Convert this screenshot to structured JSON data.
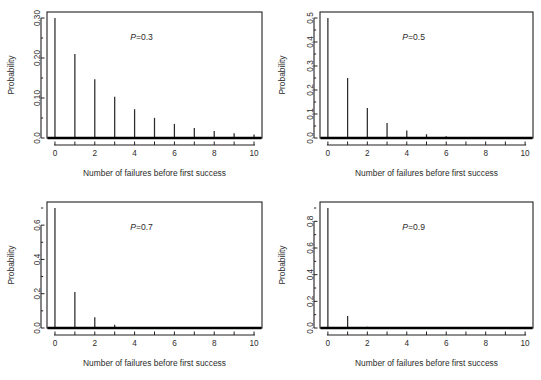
{
  "figure": {
    "title": "",
    "panel_count": 4,
    "width": 541,
    "height": 380
  },
  "chart_data": [
    {
      "type": "bar",
      "panel_id": "p-0-3",
      "title": "",
      "annotation": "P=0.3",
      "annotation_italic_part": "P",
      "annotation_rest": "=0.3",
      "probability_p": 0.3,
      "xlabel": "Number of failures before first success",
      "ylabel": "Probability",
      "x": [
        0,
        1,
        2,
        3,
        4,
        5,
        6,
        7,
        8,
        9,
        10
      ],
      "values": [
        0.3,
        0.21,
        0.147,
        0.1029,
        0.07203,
        0.050421,
        0.0352947,
        0.02470629,
        0.0172944,
        0.01210608,
        0.00847426
      ],
      "categories": [
        "0",
        "1",
        "2",
        "3",
        "4",
        "5",
        "6",
        "7",
        "8",
        "9",
        "10"
      ],
      "xlim": [
        -0.4,
        10.4
      ],
      "ylim": [
        0.0,
        0.315
      ],
      "ytick_values": [
        0.0,
        0.1,
        0.2,
        0.3
      ],
      "ytick_labels": [
        "0.0",
        "0.10",
        "0.20",
        "0.30"
      ],
      "yminor_values": [
        0.05,
        0.15,
        0.25
      ],
      "xtick_values": [
        0,
        1,
        2,
        3,
        4,
        5,
        6,
        7,
        8,
        9,
        10
      ],
      "xtick_labels": [
        "0",
        "",
        "2",
        "",
        "4",
        "",
        "6",
        "",
        "8",
        "",
        "10"
      ],
      "grid": false,
      "legend": "none"
    },
    {
      "type": "bar",
      "panel_id": "p-0-5",
      "title": "",
      "annotation": "P=0.5",
      "annotation_italic_part": "P",
      "annotation_rest": "=0.5",
      "probability_p": 0.5,
      "xlabel": "Number of failures before first success",
      "ylabel": "Probability",
      "x": [
        0,
        1,
        2,
        3,
        4,
        5,
        6,
        7,
        8,
        9,
        10
      ],
      "values": [
        0.5,
        0.25,
        0.125,
        0.0625,
        0.03125,
        0.015625,
        0.0078125,
        0.00390625,
        0.001953125,
        0.0009765625,
        0.00048828
      ],
      "categories": [
        "0",
        "1",
        "2",
        "3",
        "4",
        "5",
        "6",
        "7",
        "8",
        "9",
        "10"
      ],
      "xlim": [
        -0.4,
        10.4
      ],
      "ylim": [
        0.0,
        0.525
      ],
      "ytick_values": [
        0.0,
        0.1,
        0.2,
        0.3,
        0.4,
        0.5
      ],
      "ytick_labels": [
        "0.0",
        "0.1",
        "0.2",
        "0.3",
        "0.4",
        "0.5"
      ],
      "yminor_values": [
        0.05,
        0.15,
        0.25,
        0.35,
        0.45
      ],
      "xtick_values": [
        0,
        1,
        2,
        3,
        4,
        5,
        6,
        7,
        8,
        9,
        10
      ],
      "xtick_labels": [
        "0",
        "",
        "2",
        "",
        "4",
        "",
        "6",
        "",
        "8",
        "",
        "10"
      ],
      "grid": false,
      "legend": "none"
    },
    {
      "type": "bar",
      "panel_id": "p-0-7",
      "title": "",
      "annotation": "P=0.7",
      "annotation_italic_part": "P",
      "annotation_rest": "=0.7",
      "probability_p": 0.7,
      "xlabel": "Number of failures before first success",
      "ylabel": "Probability",
      "x": [
        0,
        1,
        2,
        3,
        4,
        5,
        6,
        7,
        8,
        9,
        10
      ],
      "values": [
        0.7,
        0.21,
        0.063,
        0.0189,
        0.00567,
        0.001701,
        0.0005103,
        0.00015309,
        4.59e-05,
        1.38e-05,
        4.1e-06
      ],
      "categories": [
        "0",
        "1",
        "2",
        "3",
        "4",
        "5",
        "6",
        "7",
        "8",
        "9",
        "10"
      ],
      "xlim": [
        -0.4,
        10.4
      ],
      "ylim": [
        0.0,
        0.735
      ],
      "ytick_values": [
        0.0,
        0.2,
        0.4,
        0.6
      ],
      "ytick_labels": [
        "0.0",
        "0.2",
        "0.4",
        "0.6"
      ],
      "yminor_values": [
        0.1,
        0.3,
        0.5,
        0.7
      ],
      "xtick_values": [
        0,
        1,
        2,
        3,
        4,
        5,
        6,
        7,
        8,
        9,
        10
      ],
      "xtick_labels": [
        "0",
        "",
        "2",
        "",
        "4",
        "",
        "6",
        "",
        "8",
        "",
        "10"
      ],
      "grid": false,
      "legend": "none"
    },
    {
      "type": "bar",
      "panel_id": "p-0-9",
      "title": "",
      "annotation": "P=0.9",
      "annotation_italic_part": "P",
      "annotation_rest": "=0.9",
      "probability_p": 0.9,
      "xlabel": "Number of failures before first success",
      "ylabel": "Probability",
      "x": [
        0,
        1,
        2,
        3,
        4,
        5,
        6,
        7,
        8,
        9,
        10
      ],
      "values": [
        0.9,
        0.09,
        0.009,
        0.0009,
        9e-05,
        9e-06,
        9e-07,
        9e-08,
        9e-09,
        9e-10,
        9e-11
      ],
      "categories": [
        "0",
        "1",
        "2",
        "3",
        "4",
        "5",
        "6",
        "7",
        "8",
        "9",
        "10"
      ],
      "xlim": [
        -0.4,
        10.4
      ],
      "ylim": [
        0.0,
        0.945
      ],
      "ytick_values": [
        0.0,
        0.2,
        0.4,
        0.6,
        0.8
      ],
      "ytick_labels": [
        "0.0",
        "0.2",
        "0.4",
        "0.6",
        "0.8"
      ],
      "yminor_values": [
        0.1,
        0.3,
        0.5,
        0.7,
        0.9
      ],
      "xtick_values": [
        0,
        1,
        2,
        3,
        4,
        5,
        6,
        7,
        8,
        9,
        10
      ],
      "xtick_labels": [
        "0",
        "",
        "2",
        "",
        "4",
        "",
        "6",
        "",
        "8",
        "",
        "10"
      ],
      "grid": false,
      "legend": "none"
    }
  ],
  "style": {
    "background": "#ffffff",
    "axis_color": "#231f20",
    "spike_color": "#2b2b2b",
    "text_color": "#2c2c2c",
    "baseline_color": "#000000"
  }
}
